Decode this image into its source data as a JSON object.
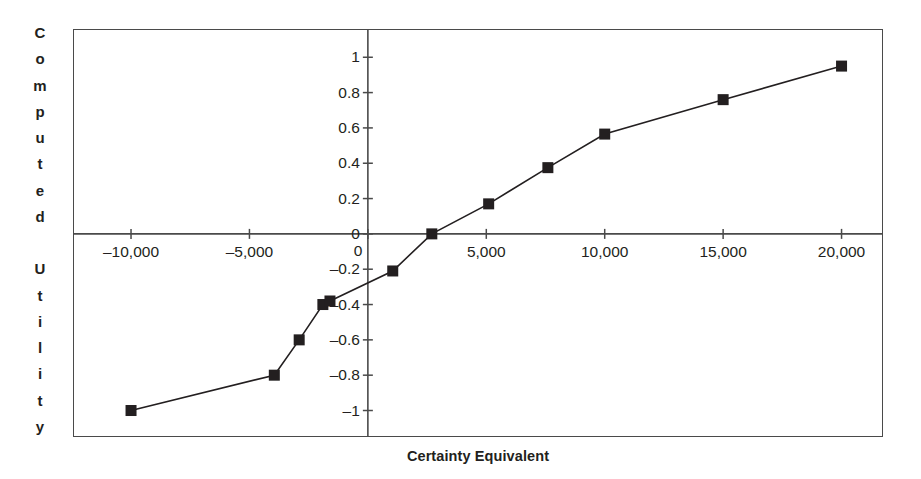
{
  "chart_data": {
    "type": "line",
    "title": "",
    "xlabel": "Certainty Equivalent",
    "ylabel": "Computed Utility",
    "xlim": [
      -12450,
      21750
    ],
    "ylim": [
      -1.15,
      1.16
    ],
    "grid": false,
    "legend": null,
    "marker": "square",
    "marker_color": "#231f20",
    "line_color": "#231f20",
    "x_ticks": [
      -10000,
      -5000,
      0,
      5000,
      10000,
      15000,
      20000
    ],
    "x_tick_labels": [
      "–10,000",
      "–5,000",
      "0",
      "5,000",
      "10,000",
      "15,000",
      "20,000"
    ],
    "y_ticks": [
      1,
      0.8,
      0.6,
      0.4,
      0.2,
      0,
      -0.2,
      -0.4,
      -0.6,
      -0.8,
      -1
    ],
    "y_tick_labels": [
      "1",
      "0.8",
      "0.6",
      "0.4",
      "0.2",
      "0",
      "–0.2",
      "–0.4",
      "–0.6",
      "–0.8",
      "–1"
    ],
    "origin_label_below_axis": "0",
    "x": [
      -10000,
      -3950,
      -2900,
      -1900,
      -1600,
      1050,
      2700,
      5100,
      7600,
      10000,
      15000,
      20000
    ],
    "y": [
      -1,
      -0.8,
      -0.6,
      -0.4,
      -0.38,
      -0.21,
      0,
      0.17,
      0.375,
      0.565,
      0.76,
      0.95
    ],
    "points": [
      {
        "x": -10000,
        "y": -1
      },
      {
        "x": -3950,
        "y": -0.8
      },
      {
        "x": -2900,
        "y": -0.6
      },
      {
        "x": -1900,
        "y": -0.4
      },
      {
        "x": -1600,
        "y": -0.38
      },
      {
        "x": 1050,
        "y": -0.21
      },
      {
        "x": 2700,
        "y": 0
      },
      {
        "x": 5100,
        "y": 0.17
      },
      {
        "x": 7600,
        "y": 0.375
      },
      {
        "x": 10000,
        "y": 0.565
      },
      {
        "x": 15000,
        "y": 0.76
      },
      {
        "x": 20000,
        "y": 0.95
      }
    ]
  },
  "axis_titles": {
    "y_letters": [
      "C",
      "o",
      "m",
      "p",
      "u",
      "t",
      "e",
      "d",
      "",
      "U",
      "t",
      "i",
      "l",
      "i",
      "t",
      "y"
    ],
    "x": "Certainty Equivalent"
  },
  "colors": {
    "ink": "#231f20",
    "frame": "#4a4a4a",
    "background": "#ffffff"
  }
}
